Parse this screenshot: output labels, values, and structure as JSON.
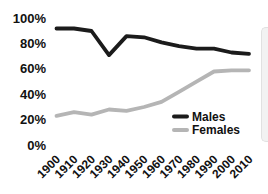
{
  "chart_data": {
    "type": "line",
    "title": "",
    "xlabel": "",
    "ylabel": "",
    "categories": [
      "1900",
      "1910",
      "1920",
      "1930",
      "1940",
      "1950",
      "1960",
      "1970",
      "1980",
      "1990",
      "2000",
      "2010"
    ],
    "series": [
      {
        "name": "Males",
        "color": "#1b1b1b",
        "values": [
          92,
          92,
          90,
          71,
          86,
          85,
          81,
          78,
          76,
          76,
          73,
          72
        ]
      },
      {
        "name": "Females",
        "color": "#b5b5b5",
        "values": [
          23,
          26,
          24,
          28,
          27,
          30,
          34,
          42,
          50,
          58,
          59,
          59
        ]
      }
    ],
    "ylim": [
      0,
      100
    ],
    "yticks": [
      0,
      20,
      40,
      60,
      80,
      100
    ],
    "ytick_suffix": "%",
    "grid": false,
    "axis_lines": false,
    "legend_position": "inside-bottom-right",
    "x_label_rotation": -45
  },
  "colors": {
    "background": "#ffffff",
    "text": "#111111",
    "males_line": "#1b1b1b",
    "females_line": "#b5b5b5",
    "panel_edge": "#f2f2f2"
  }
}
